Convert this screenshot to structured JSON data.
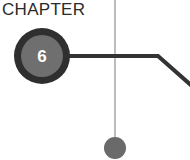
{
  "header": {
    "label": "CHAPTER"
  },
  "badge": {
    "number": "6"
  },
  "colors": {
    "ring": "#2f2f2f",
    "badge_fill": "#6f6f6f",
    "connector": "#333333",
    "timeline_line": "#7a7a7a",
    "timeline_dot": "#6a6a6a"
  }
}
